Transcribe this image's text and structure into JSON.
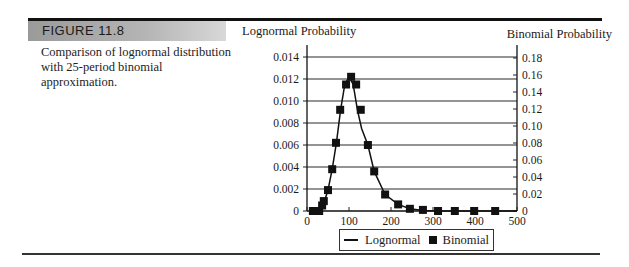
{
  "figure": {
    "label": "FIGURE 11.8",
    "caption": "Comparison of lognormal distribution with 25-period binomial approximation."
  },
  "colors": {
    "line": "#111111",
    "marker": "#111111",
    "grid": "#222222",
    "label_band": "#a8a8a8"
  },
  "chart_data": {
    "type": "line",
    "title": "",
    "xlabel": "",
    "ylabel_left": "Lognormal Probability",
    "ylabel_right": "Binomial Probability",
    "xlim": [
      0,
      500
    ],
    "ylim_left": [
      0,
      0.014
    ],
    "ylim_right": [
      0,
      0.18
    ],
    "x_ticks": [
      "0",
      "100",
      "200",
      "300",
      "400",
      "500"
    ],
    "y_ticks_left": [
      "0",
      "0.002",
      "0.004",
      "0.006",
      "0.008",
      "0.010",
      "0.012",
      "0.014"
    ],
    "y_ticks_right": [
      "0",
      "0.02",
      "0.04",
      "0.06",
      "0.08",
      "0.10",
      "0.12",
      "0.14",
      "0.16",
      "0.18"
    ],
    "grid": true,
    "legend_position": "bottom",
    "legend": [
      "Lognormal",
      "Binomial"
    ],
    "series": [
      {
        "name": "Lognormal",
        "style": "line",
        "axis": "left",
        "x": [
          10,
          20,
          30,
          40,
          50,
          60,
          70,
          80,
          90,
          100,
          110,
          120,
          130,
          145,
          160,
          186,
          217,
          245,
          276,
          312,
          352,
          398,
          448,
          500
        ],
        "y": [
          0.0,
          5e-05,
          0.0002,
          0.0007,
          0.0019,
          0.0038,
          0.0062,
          0.0092,
          0.0115,
          0.0122,
          0.0115,
          0.0092,
          0.0075,
          0.006,
          0.0036,
          0.0015,
          0.0006,
          0.0002,
          5e-05,
          0.0,
          0.0,
          0.0,
          0.0,
          0.0
        ]
      },
      {
        "name": "Binomial",
        "style": "square-markers",
        "axis": "left-scaled",
        "x": [
          14,
          21,
          29,
          36,
          40,
          50,
          60,
          69,
          79,
          93,
          105,
          117,
          128,
          145,
          160,
          186,
          217,
          245,
          276,
          312,
          352,
          398,
          448
        ],
        "y": [
          0.0,
          0.0,
          0.0,
          0.0005,
          0.0009,
          0.0019,
          0.0038,
          0.0062,
          0.0092,
          0.0115,
          0.0122,
          0.0115,
          0.0092,
          0.006,
          0.0036,
          0.0015,
          0.0006,
          0.0002,
          0.0001,
          0.0,
          0.0,
          0.0,
          0.0
        ]
      }
    ]
  },
  "legend": {
    "lognormal_label": "Lognormal",
    "binomial_label": "Binomial"
  }
}
